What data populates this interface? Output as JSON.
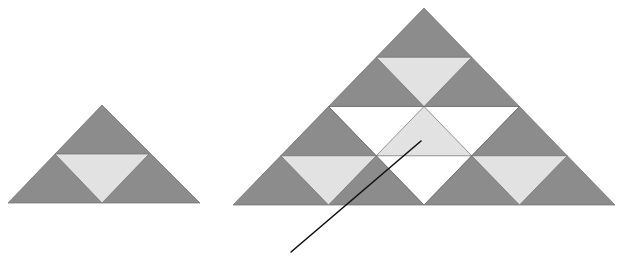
{
  "figure": {
    "type": "geometric-diagram",
    "canvas": {
      "width": 623,
      "height": 265,
      "background": "#ffffff"
    },
    "colors": {
      "fill_dark": "#8c8c8c",
      "fill_light": "#e2e2e2",
      "fill_white": "#ffffff",
      "stroke": "#6e6e6e",
      "leader_line": "#111111"
    },
    "stroke_width": 0.7,
    "shapes": {
      "left_triangle": {
        "name": "stage-1-triangle",
        "apex": [
          102,
          105
        ],
        "base_left": [
          8,
          203
        ],
        "base_right": [
          200,
          203
        ],
        "outer_points": "102,105 8,203 200,203",
        "inner_points": "55,154 149,154 102,203",
        "inner_fill": "#e2e2e2"
      },
      "right_triangle": {
        "name": "stage-2-triangle",
        "apex": [
          424,
          8
        ],
        "base_left": [
          233,
          205
        ],
        "base_right": [
          615,
          205
        ],
        "outer_points": "424,8 233,205 615,205",
        "center_inverted_points": "328.5,106.5 519.5,106.5 424,205",
        "center_inverted_fill": "#ffffff",
        "sub_units": [
          {
            "name": "sub-unit-top",
            "outer_points": "424,8 328.5,106.5 519.5,106.5",
            "inner_points": "376.25,57.25 471.75,57.25 424,106.5"
          },
          {
            "name": "sub-unit-bottom-left",
            "outer_points": "328.5,106.5 233,205 424,205",
            "inner_points": "280.75,155.75 376.25,155.75 328.5,205"
          },
          {
            "name": "sub-unit-bottom-right",
            "outer_points": "519.5,106.5 424,205 615,205",
            "inner_points": "471.75,155.75 567.25,155.75 519.5,205"
          },
          {
            "name": "sub-unit-center-inverted",
            "outer_points": "328.5,106.5 519.5,106.5 424,205",
            "inner_points": "424,106.5 471.75,155.75 376.25,155.75"
          }
        ]
      },
      "leader_line": {
        "name": "pointer-leader-line",
        "x1": 291,
        "y1": 252,
        "x2": 421,
        "y2": 141,
        "width": 1.6
      }
    }
  },
  "caption": {
    "text": "",
    "visible": false,
    "note": "clipped at image bottom edge"
  }
}
